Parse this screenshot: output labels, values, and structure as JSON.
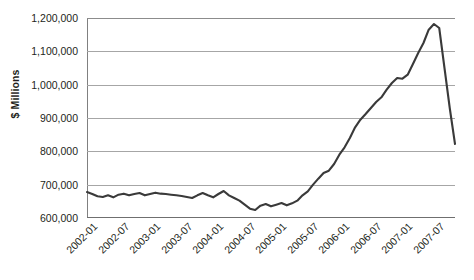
{
  "chart_data": {
    "type": "line",
    "title": "",
    "xlabel": "",
    "ylabel": "$ Millions",
    "ylim": [
      600000,
      1200000
    ],
    "ytick_labels": [
      "1,200,000",
      "1,100,000",
      "1,000,000",
      "900,000",
      "800,000",
      "700,000",
      "600,000"
    ],
    "ytick_values": [
      1200000,
      1100000,
      1000000,
      900000,
      800000,
      700000,
      600000
    ],
    "xtick_labels": [
      "2002-01",
      "2002-07",
      "2003-01",
      "2003-07",
      "2004-01",
      "2004-07",
      "2005-01",
      "2005-07",
      "2006-01",
      "2006-07",
      "2007-01",
      "2007-07"
    ],
    "grid": true,
    "legend": "none",
    "line_color": "#3a3a3a",
    "grid_color": "#a6a6a6",
    "x": [
      "2002-01",
      "2002-02",
      "2002-03",
      "2002-04",
      "2002-05",
      "2002-06",
      "2002-07",
      "2002-08",
      "2002-09",
      "2002-10",
      "2002-11",
      "2002-12",
      "2003-01",
      "2003-02",
      "2003-03",
      "2003-04",
      "2003-05",
      "2003-06",
      "2003-07",
      "2003-08",
      "2003-09",
      "2003-10",
      "2003-11",
      "2003-12",
      "2004-01",
      "2004-02",
      "2004-03",
      "2004-04",
      "2004-05",
      "2004-06",
      "2004-07",
      "2004-08",
      "2004-09",
      "2004-10",
      "2004-11",
      "2004-12",
      "2005-01",
      "2005-02",
      "2005-03",
      "2005-04",
      "2005-05",
      "2005-06",
      "2005-07",
      "2005-08",
      "2005-09",
      "2005-10",
      "2005-11",
      "2005-12",
      "2006-01",
      "2006-02",
      "2006-03",
      "2006-04",
      "2006-05",
      "2006-06",
      "2006-07",
      "2006-08",
      "2006-09",
      "2006-10",
      "2006-11",
      "2006-12",
      "2007-01",
      "2007-02",
      "2007-03",
      "2007-04",
      "2007-05",
      "2007-06",
      "2007-07",
      "2007-08",
      "2007-09",
      "2007-10",
      "2007-11"
    ],
    "values": [
      678000,
      672000,
      665000,
      663000,
      668000,
      662000,
      670000,
      673000,
      668000,
      672000,
      675000,
      668000,
      672000,
      676000,
      673000,
      672000,
      670000,
      668000,
      666000,
      663000,
      660000,
      668000,
      675000,
      668000,
      662000,
      672000,
      681000,
      668000,
      660000,
      652000,
      640000,
      628000,
      624000,
      637000,
      642000,
      635000,
      640000,
      645000,
      638000,
      644000,
      652000,
      668000,
      680000,
      700000,
      718000,
      735000,
      742000,
      762000,
      790000,
      812000,
      840000,
      872000,
      895000,
      912000,
      930000,
      948000,
      962000,
      985000,
      1005000,
      1020000,
      1018000,
      1030000,
      1062000,
      1095000,
      1125000,
      1165000,
      1182000,
      1170000,
      1050000,
      930000,
      822000
    ]
  }
}
